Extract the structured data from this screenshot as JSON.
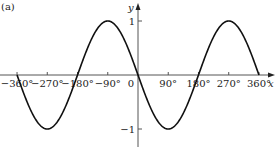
{
  "panel_label": "(a)",
  "chart_data": {
    "type": "line",
    "title": "",
    "function": "y = -sin x",
    "xlabel": "x",
    "ylabel": "y",
    "xlim": [
      -370,
      372
    ],
    "ylim": [
      -1.2,
      1.35
    ],
    "grid": false,
    "legend": "none",
    "x_ticks": [
      {
        "value": -360,
        "label": "−360°"
      },
      {
        "value": -270,
        "label": "−270°"
      },
      {
        "value": -180,
        "label": "−180°"
      },
      {
        "value": -90,
        "label": "−90°"
      },
      {
        "value": 0,
        "label": "0"
      },
      {
        "value": 90,
        "label": "90°"
      },
      {
        "value": 180,
        "label": "180°"
      },
      {
        "value": 270,
        "label": "270°"
      },
      {
        "value": 360,
        "label": "360°"
      }
    ],
    "y_ticks": [
      {
        "value": 1,
        "label": "1"
      },
      {
        "value": -1,
        "label": "−1"
      }
    ],
    "series": [
      {
        "name": "y = -sin x",
        "x": [
          -360,
          -270,
          -180,
          -90,
          0,
          90,
          180,
          270,
          360
        ],
        "values": [
          0,
          -1,
          0,
          1,
          0,
          -1,
          0,
          1,
          0
        ]
      }
    ],
    "colors": {
      "curve": "#111111",
      "axes": "#555555"
    }
  }
}
